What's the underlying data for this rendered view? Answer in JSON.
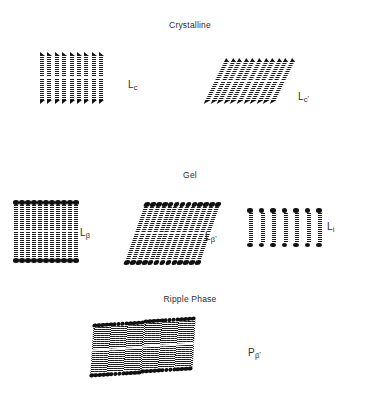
{
  "figure": {
    "title_absent": true,
    "background_color": "#ffffff",
    "ink_color": "#111111"
  },
  "sections": [
    {
      "id": "crystalline",
      "heading": "Crystalline"
    },
    {
      "id": "gel",
      "heading": "Gel"
    },
    {
      "id": "ripple",
      "heading": "Ripple Phase"
    }
  ],
  "phases": [
    {
      "id": "lc",
      "label_base": "L",
      "label_sub": "c",
      "label_prime": "",
      "section": "crystalline",
      "geometry": "untilted-bilayer",
      "head_shape": "arrow",
      "chains_per_leaflet": 9,
      "leaflets": 2
    },
    {
      "id": "lc-prime",
      "label_base": "L",
      "label_sub": "c",
      "label_prime": "'",
      "section": "crystalline",
      "geometry": "tilted-bilayer",
      "head_shape": "arrow",
      "chains_per_leaflet": 11,
      "leaflets": 2,
      "tilt_deg": 26
    },
    {
      "id": "l-beta",
      "label_base": "L",
      "label_sub": "β",
      "label_prime": "",
      "section": "gel",
      "geometry": "untilted-bilayer",
      "head_shape": "oval",
      "chains_per_leaflet": 11,
      "leaflets": 2
    },
    {
      "id": "l-beta-prime",
      "label_base": "L",
      "label_sub": "β",
      "label_prime": "'",
      "section": "gel",
      "geometry": "tilted-bilayer",
      "head_shape": "oval",
      "chains_per_leaflet": 13,
      "leaflets": 2,
      "tilt_deg": 19
    },
    {
      "id": "l-i",
      "label_base": "L",
      "label_sub": "i",
      "label_prime": "",
      "section": "gel",
      "geometry": "interdigitated",
      "head_shape": "oval",
      "chains_per_leaflet": 7,
      "leaflets": 1
    },
    {
      "id": "p-beta-prime",
      "label_base": "P",
      "label_sub": "β",
      "label_prime": "'",
      "section": "ripple",
      "geometry": "rippled-bilayer",
      "head_shape": "oval",
      "chains_per_leaflet": 26,
      "leaflets": 2,
      "ripple_domains": 2
    }
  ]
}
